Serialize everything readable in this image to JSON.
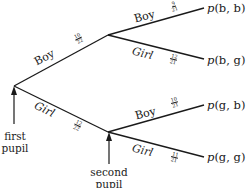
{
  "diagram": {
    "type": "probability-tree",
    "first_stage": {
      "label": "first pupil",
      "branches": [
        {
          "label": "Boy",
          "probability": {
            "num": "10",
            "den": "22"
          }
        },
        {
          "label": "Girl",
          "probability": {
            "num": "12",
            "den": "22"
          }
        }
      ]
    },
    "second_stage": {
      "label": "second pupil",
      "after_boy": [
        {
          "label": "Boy",
          "probability": {
            "num": "9",
            "den": "21"
          },
          "outcome": {
            "p": "p",
            "args": "(b, b)"
          }
        },
        {
          "label": "Girl",
          "probability": {
            "num": "12",
            "den": "21"
          },
          "outcome": {
            "p": "p",
            "args": "(b, g)"
          }
        }
      ],
      "after_girl": [
        {
          "label": "Boy",
          "probability": {
            "num": "10",
            "den": "21"
          },
          "outcome": {
            "p": "p",
            "args": "(g, b)"
          }
        },
        {
          "label": "Girl",
          "probability": {
            "num": "11",
            "den": "21"
          },
          "outcome": {
            "p": "p",
            "args": "(g, g)"
          }
        }
      ]
    },
    "line_color": "#1a1a1a"
  },
  "labels": {
    "first_pupil_line1": "first",
    "first_pupil_line2": "pupil",
    "second_pupil_line1": "second",
    "second_pupil_line2": "pupil"
  }
}
